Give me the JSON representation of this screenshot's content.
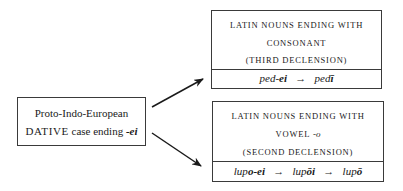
{
  "source": {
    "line1": "Proto-Indo-European",
    "line2_caps": "DATIVE",
    "line2_text": " case ending ",
    "line2_ending": "-ei"
  },
  "targets": [
    {
      "header_lines": [
        "Latin nouns ending with",
        "consonant",
        "(third declension)"
      ],
      "forms": [
        {
          "stem": "ped-",
          "bold": "ei"
        },
        {
          "arrow": "→"
        },
        {
          "stem": "ped",
          "bold": "ī"
        }
      ]
    },
    {
      "header_lines": [
        "Latin nouns ending with",
        "vowel ",
        "(second declension)"
      ],
      "header_vowel": "-o",
      "forms": [
        {
          "stem": "lup",
          "bold": "o-ei"
        },
        {
          "arrow": "→"
        },
        {
          "stem": "lup",
          "bold": "ōi"
        },
        {
          "arrow": "→"
        },
        {
          "stem": "lup",
          "bold": "ō"
        }
      ]
    }
  ],
  "arrows": [
    {
      "from": [
        152,
        107
      ],
      "to": [
        203,
        79
      ]
    },
    {
      "from": [
        152,
        133
      ],
      "to": [
        201,
        166
      ]
    }
  ],
  "colors": {
    "line": "#1a1a1a",
    "border": "#3a3a3a"
  }
}
